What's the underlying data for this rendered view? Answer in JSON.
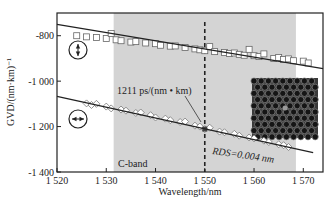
{
  "chart_data": {
    "type": "scatter",
    "title": "",
    "xlabel": "Wavelength/nm",
    "ylabel": "GVD/(nm·km)⁻¹",
    "xlim": [
      1520,
      1574
    ],
    "ylim": [
      -1400,
      -700
    ],
    "x_ticks": [
      1520,
      1530,
      1540,
      1550,
      1560,
      1570
    ],
    "x_tick_labels": [
      "1 520",
      "1 530",
      "1 540",
      "1 550",
      "1 560",
      "1 570"
    ],
    "y_ticks": [
      -800,
      -1000,
      -1200,
      -1400
    ],
    "y_tick_labels": [
      "-800",
      "-1 000",
      "-1 200",
      "-1 400"
    ],
    "grid": false,
    "shaded_region": {
      "label": "C-band",
      "x_start": 1531.5,
      "x_end": 1568.5,
      "color": "#d4d4d4"
    },
    "vertical_marker": {
      "x": 1550,
      "style": "dashed"
    },
    "series": [
      {
        "name": "vertical polarization",
        "marker": "square",
        "icon": "vertical-polarization-icon",
        "fit_line": {
          "x": [
            1520,
            1574
          ],
          "y": [
            -750,
            -945
          ]
        },
        "x": [
          1524,
          1526,
          1528,
          1530,
          1531,
          1532,
          1533,
          1535,
          1536,
          1538,
          1540,
          1541,
          1543,
          1544,
          1546,
          1548,
          1549,
          1550,
          1551,
          1552,
          1554,
          1555,
          1556,
          1557,
          1558,
          1559,
          1560,
          1561,
          1562,
          1564,
          1565,
          1566,
          1567,
          1568,
          1570,
          1571
        ],
        "y": [
          -800,
          -805,
          -808,
          -812,
          -790,
          -818,
          -822,
          -828,
          -826,
          -832,
          -835,
          -842,
          -846,
          -845,
          -852,
          -858,
          -862,
          -866,
          -848,
          -870,
          -874,
          -878,
          -876,
          -882,
          -886,
          -860,
          -888,
          -892,
          -880,
          -900,
          -896,
          -905,
          -902,
          -910,
          -912,
          -920
        ]
      },
      {
        "name": "horizontal polarization",
        "marker": "diamond",
        "icon": "horizontal-polarization-icon",
        "fit_line": {
          "x": [
            1520,
            1572
          ],
          "y": [
            -1067,
            -1315
          ]
        },
        "x": [
          1526,
          1527,
          1528,
          1530,
          1531,
          1533,
          1534,
          1536,
          1537,
          1539,
          1540,
          1542,
          1543,
          1545,
          1546,
          1548,
          1549,
          1550,
          1551,
          1553,
          1554,
          1556,
          1557,
          1559,
          1560,
          1562,
          1563,
          1565,
          1566,
          1567
        ],
        "y": [
          -1098,
          -1105,
          -1100,
          -1112,
          -1120,
          -1125,
          -1130,
          -1140,
          -1138,
          -1150,
          -1160,
          -1165,
          -1172,
          -1180,
          -1178,
          -1196,
          -1200,
          -1211,
          -1205,
          -1222,
          -1225,
          -1232,
          -1240,
          -1248,
          -1252,
          -1262,
          -1268,
          -1278,
          -1282,
          -1290
        ]
      }
    ],
    "annotations": [
      {
        "text": "1211 ps/(nm • km)",
        "x": 1539.5,
        "y": -1150,
        "arrow_to": [
          1550,
          -1211
        ]
      },
      {
        "text": "RDS=0.004 nm",
        "x": 1556,
        "y": -1325,
        "italic": true
      },
      {
        "text": "C-band",
        "x": 1533,
        "y": -1365
      }
    ],
    "inset": {
      "description": "photonic crystal fiber cross-section micrograph",
      "position": "right, middle"
    }
  },
  "labels": {
    "x_axis_title": "Wavelength/nm",
    "y_axis_title": "GVD/(nm·km)⁻¹",
    "slope_annotation": "1211 ps/(nm • km)",
    "rds_annotation": "RDS=0.004 nm",
    "band_label": "C-band",
    "x_tick_labels": [
      "1 520",
      "1 530",
      "1 540",
      "1 550",
      "1 560",
      "1 570"
    ],
    "y_tick_labels": [
      "-800",
      "-1 000",
      "-1 200",
      "-1 400"
    ]
  }
}
